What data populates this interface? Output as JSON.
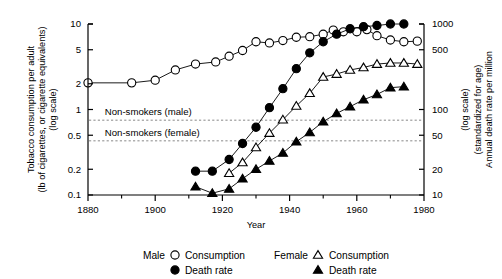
{
  "chart_data": {
    "type": "line",
    "title": "",
    "xlabel": "Year",
    "ylabel_left": "Tobacco consumption per adult (lb of cigarettes, or cigarette equivalents) (log scale)",
    "ylabel_left_line1": "Tobacco consumption per adult",
    "ylabel_left_line2": "(lb of cigarettes, or cigarette equivalents)",
    "ylabel_left_line3": "(log scale)",
    "ylabel_right": "Annual death rate per million (standardized for age) (log scale)",
    "ylabel_right_line1": "Annual death rate per million",
    "ylabel_right_line2": "(standardized for age)",
    "ylabel_right_line3": "(log scale)",
    "xlim": [
      1880,
      1980
    ],
    "xticks": [
      1880,
      1900,
      1920,
      1940,
      1960,
      1980
    ],
    "xminorticks": [
      1890,
      1910,
      1930,
      1950,
      1970
    ],
    "xticklabels": [
      "1880",
      "1900",
      "1920",
      "1940",
      "1960",
      "1980"
    ],
    "ylim_left": [
      0.1,
      10
    ],
    "yticks_left": [
      0.1,
      0.2,
      0.5,
      1,
      2,
      5,
      10
    ],
    "yticklabels_left": [
      "0.1",
      "0.2",
      "0.5",
      "1",
      "2",
      "5",
      "10"
    ],
    "ylim_right": [
      10,
      1000
    ],
    "yticks_right": [
      10,
      20,
      50,
      100,
      500,
      1000
    ],
    "yticklabels_right": [
      "10",
      "20",
      "50",
      "100",
      "500",
      "1000"
    ],
    "grid": false,
    "legend_position": "below",
    "reference_lines": [
      {
        "name": "non-smokers-male",
        "label": "Non-smokers (male)",
        "value_right": 75,
        "label_x": 1885,
        "label_y_offset": -5
      },
      {
        "name": "non-smokers-female",
        "label": "Non-smokers (female)",
        "value_right": 43,
        "label_x": 1885,
        "label_y_offset": -5
      }
    ],
    "series": [
      {
        "name": "Male Consumption",
        "group": "Male",
        "measure": "Consumption",
        "marker": "open-circle",
        "axis": "left",
        "x": [
          1880,
          1893,
          1900,
          1906,
          1912,
          1918,
          1922,
          1926,
          1930,
          1934,
          1938,
          1942,
          1946,
          1950,
          1953,
          1956,
          1960,
          1963,
          1966,
          1970,
          1974,
          1978
        ],
        "y": [
          2.05,
          2.05,
          2.2,
          2.9,
          3.4,
          3.6,
          4.2,
          4.9,
          6.2,
          6.0,
          6.4,
          7.0,
          7.1,
          7.6,
          8.5,
          8.1,
          8.1,
          8.6,
          7.3,
          6.5,
          6.2,
          6.3
        ]
      },
      {
        "name": "Male Death rate",
        "group": "Male",
        "measure": "Death rate",
        "marker": "filled-circle",
        "axis": "right",
        "x": [
          1912,
          1917,
          1922,
          1926,
          1930,
          1934,
          1938,
          1942,
          1946,
          1950,
          1954,
          1958,
          1962,
          1966,
          1970,
          1974
        ],
        "y": [
          19,
          19,
          26,
          40,
          62,
          105,
          175,
          300,
          460,
          620,
          760,
          880,
          930,
          960,
          1000,
          1000
        ]
      },
      {
        "name": "Female Consumption",
        "group": "Female",
        "measure": "Consumption",
        "marker": "open-triangle",
        "axis": "left",
        "x": [
          1922,
          1926,
          1930,
          1934,
          1938,
          1942,
          1946,
          1950,
          1954,
          1958,
          1962,
          1966,
          1970,
          1974,
          1978
        ],
        "y": [
          0.18,
          0.24,
          0.36,
          0.53,
          0.76,
          1.1,
          1.55,
          2.4,
          2.6,
          2.9,
          3.1,
          3.4,
          3.5,
          3.5,
          3.4
        ]
      },
      {
        "name": "Female Death rate",
        "group": "Female",
        "measure": "Death rate",
        "marker": "filled-triangle",
        "axis": "right",
        "x": [
          1912,
          1917,
          1922,
          1926,
          1930,
          1934,
          1938,
          1942,
          1946,
          1950,
          1954,
          1958,
          1962,
          1966,
          1970,
          1974
        ],
        "y": [
          12.5,
          10.5,
          11.8,
          15.5,
          20,
          25,
          31,
          42,
          54,
          72,
          90,
          108,
          130,
          150,
          180,
          185
        ]
      }
    ]
  },
  "legend": {
    "items": [
      {
        "group": "Male",
        "marker": "open-circle",
        "label": "Consumption"
      },
      {
        "group": "",
        "marker": "filled-circle",
        "label": "Death rate"
      },
      {
        "group": "Female",
        "marker": "open-triangle",
        "label": "Consumption"
      },
      {
        "group": "",
        "marker": "filled-triangle",
        "label": "Death rate"
      }
    ],
    "male_group_label": "Male",
    "female_group_label": "Female",
    "consumption_label": "Consumption",
    "death_rate_label": "Death rate"
  },
  "colors": {
    "ink": "#000000",
    "background": "#ffffff",
    "reference_line": "#888888"
  }
}
